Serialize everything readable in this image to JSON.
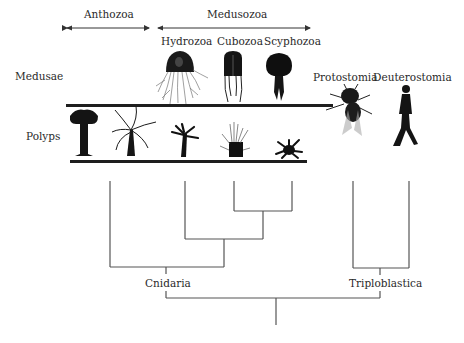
{
  "clade_headers": {
    "anthozoa": "Anthozoa",
    "medusozoa": "Medusozoa"
  },
  "taxa": {
    "hydrozoa": "Hydrozoa",
    "cubozoa": "Cubozoa",
    "scyphozoa": "Scyphozoa",
    "protostomia": "Protostomia",
    "deuterostomia": "Deuterostomia"
  },
  "row_labels": {
    "medusae": "Medusae",
    "polyps": "Polyps"
  },
  "nodes": {
    "cnidaria": "Cnidaria",
    "triploblastica": "Triploblastica"
  },
  "illustrations": {
    "medusae": [
      "hydrozoan-medusa",
      "cubozoan-medusa",
      "scyphozoan-medusa"
    ],
    "polyps": [
      "anthozoan-polyp-1",
      "anthozoan-polyp-2",
      "hydrozoan-polyp",
      "cubozoan-polyp",
      "scyphozoan-polyp"
    ],
    "bilaterians": [
      "fly",
      "human"
    ]
  },
  "colors": {
    "line": "#555555",
    "bar": "#1e1e1e",
    "text": "#2a2a2a",
    "silhouette": "#151515"
  }
}
